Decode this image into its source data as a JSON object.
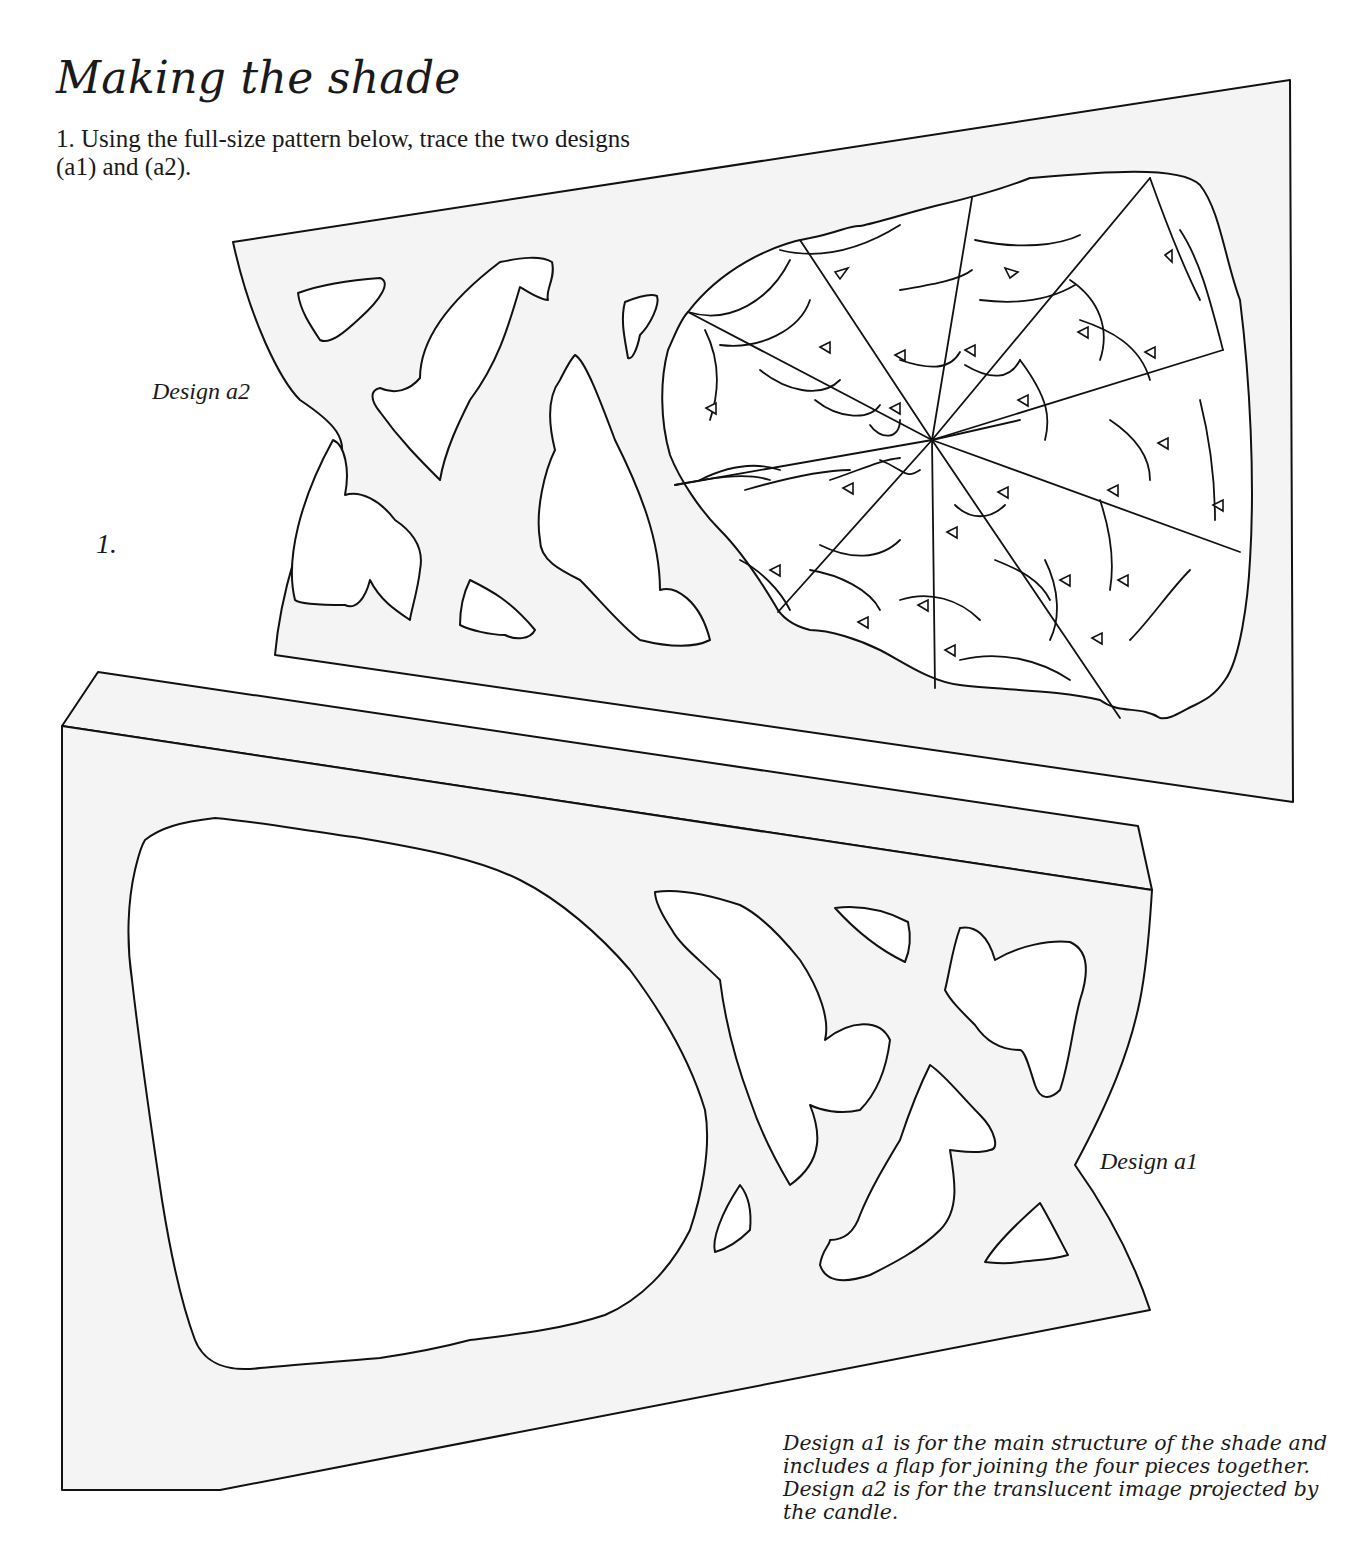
{
  "page": {
    "title": "Making the shade",
    "intro": "1. Using the full-size pattern below, trace the two designs (a1) and (a2).",
    "step_number": "1."
  },
  "figures": {
    "design_a2": {
      "label": "Design a2",
      "description": "Translucent panel with cut-out shapes and spider web"
    },
    "design_a1": {
      "label": "Design a1",
      "description": "Main structure panel with large opening, cut-out shapes and joining flap"
    }
  },
  "caption": "Design a1 is for the main structure of the shade and includes a flap for joining the four pieces together. Design a2 is for the translucent image projected by the candle.",
  "colors": {
    "background": "#ffffff",
    "panel_fill": "#f4f4f4",
    "line": "#111111",
    "text": "#1a1a1a"
  }
}
